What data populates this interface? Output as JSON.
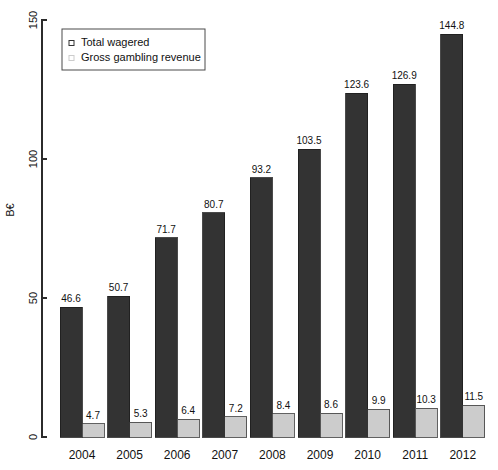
{
  "chart_data": {
    "type": "bar",
    "title": "",
    "xlabel": "",
    "ylabel": "B€",
    "ylim": [
      0,
      150
    ],
    "yticks": [
      0,
      50,
      100,
      150
    ],
    "ytick_labels": [
      "0",
      "50",
      "100",
      "150"
    ],
    "grid": false,
    "legend_position": "top-left",
    "categories": [
      "2004",
      "2005",
      "2006",
      "2007",
      "2008",
      "2009",
      "2010",
      "2011",
      "2012"
    ],
    "series": [
      {
        "name": "Total wagered",
        "color": "#333333",
        "marker": "open-square",
        "values": [
          46.6,
          50.7,
          71.7,
          80.7,
          93.2,
          103.5,
          123.6,
          126.9,
          144.8
        ],
        "value_labels": [
          "46.6",
          "50.7",
          "71.7",
          "80.7",
          "93.2",
          "103.5",
          "123.6",
          "126.9",
          "144.8"
        ]
      },
      {
        "name": "Gross gambling revenue",
        "color": "#cccccc",
        "marker": "open-square",
        "values": [
          4.7,
          5.3,
          6.4,
          7.2,
          8.4,
          8.6,
          9.9,
          10.3,
          11.5
        ],
        "value_labels": [
          "4.7",
          "5.3",
          "6.4",
          "7.2",
          "8.4",
          "8.6",
          "9.9",
          "10.3",
          "11.5"
        ]
      }
    ]
  },
  "legend": {
    "entries": [
      {
        "label": "Total wagered"
      },
      {
        "label": "Gross gambling revenue"
      }
    ]
  },
  "axes": {
    "y_axis_title": "B€"
  }
}
